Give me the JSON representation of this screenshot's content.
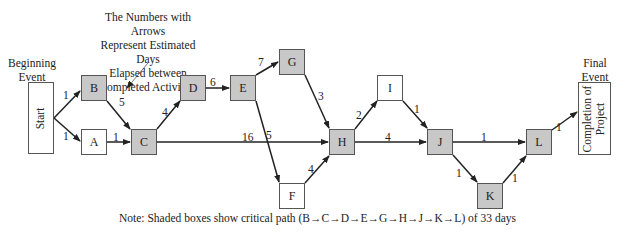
{
  "annotation": {
    "lines": [
      "The Numbers with Arrows",
      "Represent Estimated Days",
      "Elapsed between",
      "Completed Activities"
    ]
  },
  "begin_event": {
    "label_lines": [
      "Beginning",
      "Event"
    ],
    "box_text": "Start"
  },
  "final_event": {
    "label_lines": [
      "Final",
      "Event"
    ],
    "box_lines": [
      "Completion of",
      "Project"
    ]
  },
  "nodes": [
    {
      "id": "B",
      "shaded": true
    },
    {
      "id": "A",
      "shaded": false
    },
    {
      "id": "C",
      "shaded": true
    },
    {
      "id": "D",
      "shaded": true
    },
    {
      "id": "E",
      "shaded": true
    },
    {
      "id": "G",
      "shaded": true
    },
    {
      "id": "F",
      "shaded": false
    },
    {
      "id": "H",
      "shaded": true
    },
    {
      "id": "I",
      "shaded": false
    },
    {
      "id": "J",
      "shaded": true
    },
    {
      "id": "K",
      "shaded": true
    },
    {
      "id": "L",
      "shaded": true
    }
  ],
  "edges": [
    {
      "from": "Start",
      "to": "B",
      "days": "1"
    },
    {
      "from": "Start",
      "to": "A",
      "days": "1"
    },
    {
      "from": "A",
      "to": "C",
      "days": "1"
    },
    {
      "from": "B",
      "to": "C",
      "days": "5"
    },
    {
      "from": "C",
      "to": "D",
      "days": "4"
    },
    {
      "from": "D",
      "to": "E",
      "days": "6"
    },
    {
      "from": "E",
      "to": "G",
      "days": "7"
    },
    {
      "from": "E",
      "to": "F",
      "days": "5"
    },
    {
      "from": "C",
      "to": "H",
      "days": "16"
    },
    {
      "from": "G",
      "to": "H",
      "days": "3"
    },
    {
      "from": "F",
      "to": "H",
      "days": "4"
    },
    {
      "from": "H",
      "to": "I",
      "days": "2"
    },
    {
      "from": "H",
      "to": "J",
      "days": "4"
    },
    {
      "from": "I",
      "to": "J",
      "days": "1"
    },
    {
      "from": "J",
      "to": "L",
      "days": "1"
    },
    {
      "from": "J",
      "to": "K",
      "days": "1"
    },
    {
      "from": "K",
      "to": "L",
      "days": "1"
    },
    {
      "from": "L",
      "to": "Completion",
      "days": "1"
    }
  ],
  "note": "Note: Shaded boxes show critical path (B→C→D→E→G→H→J→K→L) of 33 days",
  "colors": {
    "shaded": "#c8c8c8",
    "line": "#222222",
    "border": "#555555"
  }
}
